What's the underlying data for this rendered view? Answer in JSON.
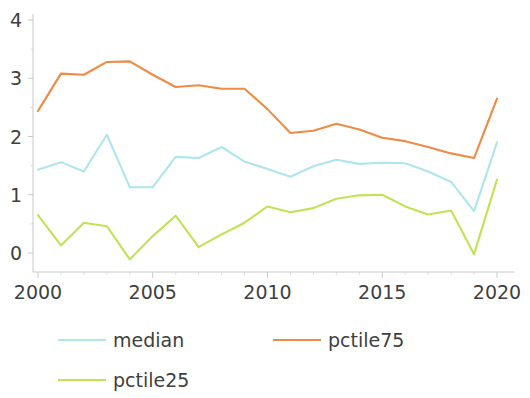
{
  "chart_data": {
    "type": "line",
    "title": "",
    "subtitle": "",
    "xlabel": "",
    "ylabel": "",
    "xlim": [
      2000,
      2020
    ],
    "ylim": [
      -0.35,
      4.15
    ],
    "grid": false,
    "legend_position": "bottom",
    "x": [
      2000,
      2001,
      2002,
      2003,
      2004,
      2005,
      2006,
      2007,
      2008,
      2009,
      2010,
      2011,
      2012,
      2013,
      2014,
      2015,
      2016,
      2017,
      2018,
      2019,
      2020
    ],
    "xticks": [
      2000,
      2005,
      2010,
      2015,
      2020
    ],
    "xtick_labels": [
      "2000",
      "2005",
      "2010",
      "2015",
      "2020"
    ],
    "yticks": [
      0,
      1,
      2,
      3,
      4
    ],
    "ytick_labels": [
      "0",
      "1",
      "2",
      "3",
      "4"
    ],
    "series": [
      {
        "name": "median",
        "color": "#aee5ef",
        "values": [
          1.43,
          1.56,
          1.4,
          2.03,
          1.13,
          1.13,
          1.65,
          1.63,
          1.82,
          1.57,
          1.44,
          1.31,
          1.49,
          1.6,
          1.53,
          1.55,
          1.54,
          1.4,
          1.22,
          0.72,
          1.9
        ]
      },
      {
        "name": "pctile75",
        "color": "#ef8b44",
        "values": [
          2.44,
          3.08,
          3.06,
          3.28,
          3.29,
          3.06,
          2.85,
          2.88,
          2.82,
          2.82,
          2.47,
          2.06,
          2.1,
          2.22,
          2.12,
          1.98,
          1.92,
          1.82,
          1.71,
          1.63,
          2.65
        ]
      },
      {
        "name": "pctile25",
        "color": "#c0e356",
        "values": [
          0.65,
          0.13,
          0.52,
          0.46,
          -0.11,
          0.29,
          0.64,
          0.1,
          0.32,
          0.52,
          0.8,
          0.7,
          0.77,
          0.93,
          0.99,
          1.0,
          0.8,
          0.66,
          0.73,
          -0.02,
          1.26
        ]
      }
    ],
    "legend": [
      {
        "label": "median",
        "color": "#aee5ef"
      },
      {
        "label": "pctile75",
        "color": "#ef8b44"
      },
      {
        "label": "pctile25",
        "color": "#c0e356"
      }
    ],
    "axis_color": "#c9c9c9",
    "text_color": "#3f3f3f",
    "background": "#ffffff"
  }
}
